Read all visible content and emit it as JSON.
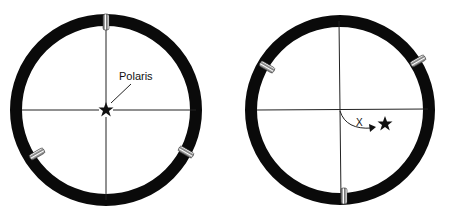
{
  "diagram": {
    "type": "telescope finder reticle views",
    "panels": [
      {
        "id": "left",
        "description": "Finder reticle with Polaris centered at crosshair; adjustment screws at top, lower-left, lower-right",
        "star_label": "Polaris",
        "center": [
          106,
          110
        ],
        "outer_radius": 96,
        "ring_width": 12,
        "screws_deg": [
          270,
          150,
          30
        ]
      },
      {
        "id": "right",
        "description": "Finder reticle with star offset from crosshair; curved arrow labeled X from center toward star; screws at upper-left, upper-right, bottom",
        "arrow_label": "X",
        "center": [
          340,
          110
        ],
        "outer_radius": 95,
        "ring_width": 12,
        "screws_deg": [
          210,
          330,
          90
        ]
      }
    ],
    "colors": {
      "ring": "#0a0a0a",
      "line": "#222222",
      "background": "#ffffff"
    }
  }
}
